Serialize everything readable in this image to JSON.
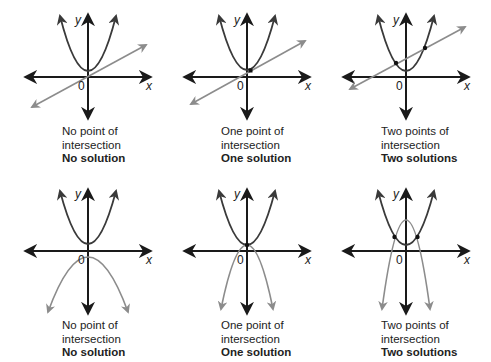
{
  "colors": {
    "axis": "#1a1a1a",
    "primary_curve": "#3a3a3a",
    "secondary_curve": "#8c8c8c",
    "point": "#111111"
  },
  "axis_labels": {
    "x": "x",
    "y": "y",
    "origin": "0"
  },
  "panels": [
    {
      "id": "p1",
      "cx": 88,
      "cy": 77,
      "line1": "No point of",
      "line2": "intersection",
      "result": "No solution",
      "kind": "line",
      "points": 0
    },
    {
      "id": "p2",
      "cx": 247,
      "cy": 77,
      "line1": "One point of",
      "line2": "intersection",
      "result": "One solution",
      "kind": "line",
      "points": 1
    },
    {
      "id": "p3",
      "cx": 406,
      "cy": 77,
      "line1": "Two points of",
      "line2": "intersection",
      "result": "Two solutions",
      "kind": "line",
      "points": 2
    },
    {
      "id": "p4",
      "cx": 88,
      "cy": 251,
      "line1": "No point of",
      "line2": "intersection",
      "result": "No solution",
      "kind": "parabola",
      "points": 0
    },
    {
      "id": "p5",
      "cx": 247,
      "cy": 251,
      "line1": "One point of",
      "line2": "intersection",
      "result": "One solution",
      "kind": "parabola",
      "points": 1
    },
    {
      "id": "p6",
      "cx": 406,
      "cy": 251,
      "line1": "Two points of",
      "line2": "intersection",
      "result": "Two solutions",
      "kind": "parabola",
      "points": 2
    }
  ]
}
